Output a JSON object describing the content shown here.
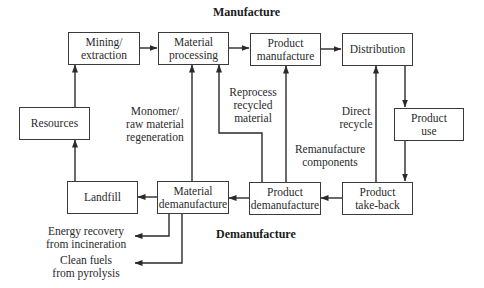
{
  "sections": {
    "manufacture": "Manufacture",
    "demanufacture": "Demanufacture"
  },
  "nodes": {
    "mining": [
      "Mining/",
      "extraction"
    ],
    "material_processing": [
      "Material",
      "processing"
    ],
    "product_manufacture": [
      "Product",
      "manufacture"
    ],
    "distribution": [
      "Distribution"
    ],
    "product_use": [
      "Product",
      "use"
    ],
    "resources": [
      "Resources"
    ],
    "landfill": [
      "Landfill"
    ],
    "material_demanufacture": [
      "Material",
      "demanufacture"
    ],
    "product_demanufacture": [
      "Product",
      "demanufacture"
    ],
    "product_takeback": [
      "Product",
      "take-back"
    ]
  },
  "edge_labels": {
    "monomer": [
      "Monomer/",
      "raw material",
      "regeneration"
    ],
    "reprocess": [
      "Reprocess",
      "recycled",
      "material"
    ],
    "remanufacture": [
      "Remanufacture",
      "components"
    ],
    "direct_recycle": [
      "Direct",
      "recycle"
    ],
    "energy_recovery": [
      "Energy recovery",
      "from incineration"
    ],
    "clean_fuels": [
      "Clean fuels",
      "from pyrolysis"
    ]
  },
  "colors": {
    "line": "#2a2a2a",
    "box_border": "#3a3a3a",
    "background": "#ffffff"
  }
}
